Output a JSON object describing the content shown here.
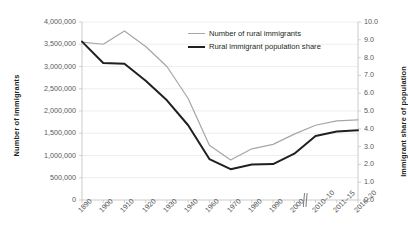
{
  "chart_data": {
    "type": "line",
    "title": "",
    "subtitle": "",
    "xlabel": "",
    "ylabel": "Number of immigrants",
    "ylabel_secondary": "Immigrant share of population",
    "categories": [
      "1890",
      "1900",
      "1910",
      "1920",
      "1930",
      "1940",
      "1960",
      "1970",
      "1980",
      "1990",
      "2000",
      "2010–10",
      "2011–15",
      "2016–20"
    ],
    "ylim": [
      0,
      4000000
    ],
    "ylim_secondary": [
      0,
      10.0
    ],
    "ytick_labels": [
      "4,000,000",
      "3,500,000",
      "3,000,000",
      "2,500,000",
      "2,000,000",
      "1,500,000",
      "1,000,000",
      "500,000",
      "0"
    ],
    "ytick_values": [
      4000000,
      3500000,
      3000000,
      2500000,
      2000000,
      1500000,
      1000000,
      500000,
      0
    ],
    "ytick_labels_secondary": [
      "10.0",
      "9.0",
      "8.0",
      "7.0",
      "6.0",
      "5.0",
      "4.0",
      "3.0",
      "2.0",
      "1.0",
      "0.0"
    ],
    "ytick_values_secondary": [
      10.0,
      9.0,
      8.0,
      7.0,
      6.0,
      5.0,
      4.0,
      3.0,
      2.0,
      1.0,
      0.0
    ],
    "grid": true,
    "grid_axis": "y",
    "legend_position": "upper-center",
    "axis_break": {
      "present": true,
      "after_category": "2000",
      "style": "double-slash"
    },
    "series": [
      {
        "name": "Number of rural immigrants",
        "axis": "left",
        "color": "#a6a6a6",
        "width": 1.2,
        "values": [
          3550000,
          3500000,
          3800000,
          3450000,
          3000000,
          2280000,
          1230000,
          900000,
          1150000,
          1250000,
          1480000,
          1680000,
          1780000,
          1800000
        ]
      },
      {
        "name": "Rural immigrant population share",
        "axis": "right",
        "color": "#231f20",
        "width": 2.0,
        "values": [
          8.9,
          7.7,
          7.65,
          6.7,
          5.6,
          4.2,
          2.3,
          1.73,
          2.0,
          2.02,
          2.6,
          3.6,
          3.85,
          3.92
        ]
      }
    ]
  },
  "legend": {
    "items": [
      {
        "label": "Number of rural immigrants",
        "color": "#a6a6a6"
      },
      {
        "label": "Rural immigrant population share",
        "color": "#231f20"
      }
    ]
  }
}
